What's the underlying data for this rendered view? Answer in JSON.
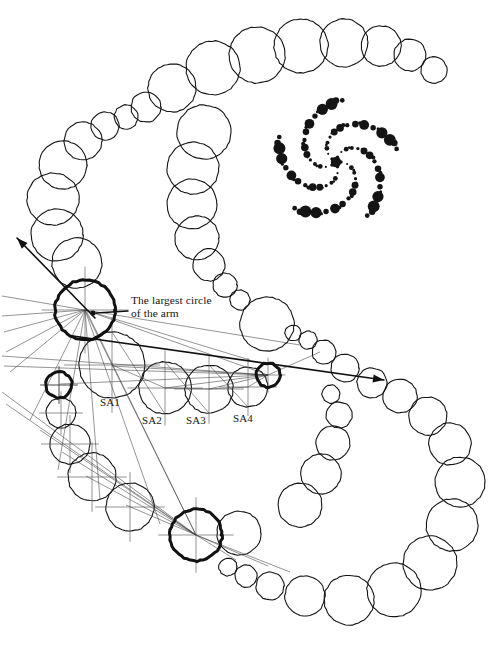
{
  "figure": {
    "title_caption": "",
    "background_color": "#ffffff",
    "ink_color": "#121212",
    "annotation": {
      "line1": "The largest circle",
      "line2": "of the arm"
    },
    "arm_labels": [
      {
        "id": "SA1",
        "text": "SA1",
        "x": 100,
        "y": 396
      },
      {
        "id": "SA2",
        "text": "SA2",
        "x": 142,
        "y": 414
      },
      {
        "id": "SA3",
        "text": "SA3",
        "x": 186,
        "y": 414
      },
      {
        "id": "SA4",
        "text": "SA4",
        "x": 233,
        "y": 412
      }
    ],
    "outer_chain": {
      "description": "open chain of tangent outline circles forming a large spiral arm",
      "stroke": "#151515",
      "stroke_width": 1.1,
      "circles": [
        {
          "cx": 434,
          "cy": 70,
          "r": 13
        },
        {
          "cx": 410,
          "cy": 55,
          "r": 16
        },
        {
          "cx": 381,
          "cy": 46,
          "r": 20
        },
        {
          "cx": 344,
          "cy": 43,
          "r": 24
        },
        {
          "cx": 301,
          "cy": 46,
          "r": 27
        },
        {
          "cx": 257,
          "cy": 55,
          "r": 28
        },
        {
          "cx": 213,
          "cy": 68,
          "r": 27
        },
        {
          "cx": 172,
          "cy": 88,
          "r": 24
        },
        {
          "cx": 146,
          "cy": 107,
          "r": 15
        },
        {
          "cx": 126,
          "cy": 117,
          "r": 12
        },
        {
          "cx": 105,
          "cy": 126,
          "r": 14
        },
        {
          "cx": 83,
          "cy": 141,
          "r": 19
        },
        {
          "cx": 63,
          "cy": 165,
          "r": 24
        },
        {
          "cx": 53,
          "cy": 199,
          "r": 26
        },
        {
          "cx": 57,
          "cy": 235,
          "r": 26
        },
        {
          "cx": 77,
          "cy": 263,
          "r": 25
        },
        {
          "cx": 85,
          "cy": 310,
          "r": 30
        },
        {
          "cx": 59,
          "cy": 385,
          "r": 13
        },
        {
          "cx": 61,
          "cy": 413,
          "r": 15
        },
        {
          "cx": 70,
          "cy": 444,
          "r": 20
        },
        {
          "cx": 92,
          "cy": 477,
          "r": 24
        },
        {
          "cx": 130,
          "cy": 507,
          "r": 24
        },
        {
          "cx": 196,
          "cy": 535,
          "r": 26
        },
        {
          "cx": 239,
          "cy": 533,
          "r": 22
        },
        {
          "cx": 228,
          "cy": 567,
          "r": 9
        },
        {
          "cx": 246,
          "cy": 576,
          "r": 11
        },
        {
          "cx": 270,
          "cy": 586,
          "r": 14
        },
        {
          "cx": 305,
          "cy": 596,
          "r": 20
        },
        {
          "cx": 349,
          "cy": 600,
          "r": 25
        },
        {
          "cx": 394,
          "cy": 590,
          "r": 27
        },
        {
          "cx": 430,
          "cy": 563,
          "r": 27
        },
        {
          "cx": 452,
          "cy": 525,
          "r": 26
        },
        {
          "cx": 460,
          "cy": 482,
          "r": 25
        },
        {
          "cx": 450,
          "cy": 444,
          "r": 21
        },
        {
          "cx": 428,
          "cy": 416,
          "r": 19
        },
        {
          "cx": 400,
          "cy": 396,
          "r": 17
        },
        {
          "cx": 372,
          "cy": 383,
          "r": 15
        },
        {
          "cx": 345,
          "cy": 368,
          "r": 14
        },
        {
          "cx": 324,
          "cy": 352,
          "r": 12
        },
        {
          "cx": 308,
          "cy": 340,
          "r": 9
        },
        {
          "cx": 293,
          "cy": 333,
          "r": 8
        },
        {
          "cx": 267,
          "cy": 324,
          "r": 27
        },
        {
          "cx": 240,
          "cy": 300,
          "r": 10
        },
        {
          "cx": 225,
          "cy": 285,
          "r": 12
        },
        {
          "cx": 209,
          "cy": 265,
          "r": 16
        },
        {
          "cx": 197,
          "cy": 238,
          "r": 22
        },
        {
          "cx": 192,
          "cy": 204,
          "r": 25
        },
        {
          "cx": 193,
          "cy": 168,
          "r": 26
        },
        {
          "cx": 204,
          "cy": 132,
          "r": 27
        },
        {
          "cx": 331,
          "cy": 394,
          "r": 9
        },
        {
          "cx": 339,
          "cy": 415,
          "r": 13
        },
        {
          "cx": 333,
          "cy": 443,
          "r": 17
        },
        {
          "cx": 321,
          "cy": 474,
          "r": 20
        },
        {
          "cx": 300,
          "cy": 505,
          "r": 22
        }
      ]
    },
    "inner_chain": {
      "description": "secondary arc of tangent circles SA1..SA4 beneath the largest circle",
      "circles": [
        {
          "cx": 112,
          "cy": 365,
          "r": 33
        },
        {
          "cx": 165,
          "cy": 388,
          "r": 26
        },
        {
          "cx": 209,
          "cy": 389,
          "r": 24
        },
        {
          "cx": 248,
          "cy": 387,
          "r": 20
        }
      ]
    },
    "highlighted_circles": {
      "description": "bold-stroked key circles of the construction",
      "stroke_width": 3.0,
      "circles": [
        {
          "cx": 85,
          "cy": 310,
          "r": 30,
          "name": "largest-circle-of-arm"
        },
        {
          "cx": 59,
          "cy": 385,
          "r": 13,
          "name": "bold-circle-left"
        },
        {
          "cx": 268,
          "cy": 375,
          "r": 12,
          "name": "bold-circle-right"
        },
        {
          "cx": 196,
          "cy": 535,
          "r": 26,
          "name": "bold-circle-bottom"
        }
      ]
    },
    "center_dot": {
      "cx": 93,
      "cy": 313,
      "r": 2.6
    },
    "leader_line": {
      "x1": 128,
      "y1": 311,
      "x2": 96,
      "y2": 313
    },
    "arrows": [
      {
        "name": "arrow-upper-left",
        "x1": 95,
        "y1": 318,
        "x2": 17,
        "y2": 238
      },
      {
        "name": "arrow-right",
        "x1": 73,
        "y1": 336,
        "x2": 384,
        "y2": 380
      }
    ],
    "construction_lines_count": 22,
    "pinwheel": {
      "description": "inset spiral pinwheel of filled dots, five arms",
      "center": {
        "cx": 336,
        "cy": 162
      },
      "arm_count": 5,
      "fill": "#141414",
      "dots_per_arm": 14
    }
  }
}
